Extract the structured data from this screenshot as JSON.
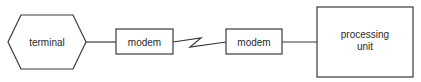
{
  "diagram": {
    "nodes": [
      {
        "id": "terminal",
        "label": "terminal",
        "shape": "hexagon"
      },
      {
        "id": "modem1",
        "label": "modem",
        "shape": "rectangle"
      },
      {
        "id": "modem2",
        "label": "modem",
        "shape": "rectangle"
      },
      {
        "id": "processing_unit",
        "label_line1": "processing",
        "label_line2": "unit",
        "shape": "rectangle"
      }
    ],
    "edges": [
      {
        "from": "terminal",
        "to": "modem1",
        "style": "line"
      },
      {
        "from": "modem1",
        "to": "modem2",
        "style": "zigzag (telecommunication link)"
      },
      {
        "from": "modem2",
        "to": "processing_unit",
        "style": "line"
      }
    ],
    "colors": {
      "stroke": "#3a3a3a",
      "text": "#2a2a2a",
      "background": "#ffffff"
    }
  }
}
